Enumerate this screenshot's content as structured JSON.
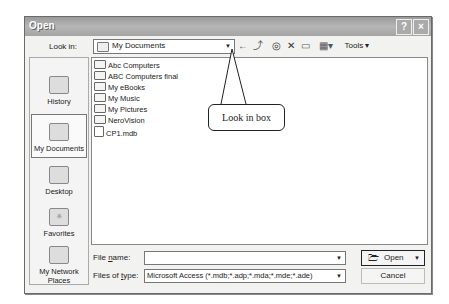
{
  "window": {
    "title": "Open",
    "help_glyph": "?",
    "close_glyph": "×"
  },
  "toolbar": {
    "look_in_label": "Look in:",
    "look_in_value": "My Documents",
    "back_icon": "←",
    "up_folder_icon": "⤴",
    "search_web_icon": "🔍",
    "delete_icon": "✕",
    "new_folder_icon": "🗀",
    "views_icon": "▦",
    "tools_label": "Tools"
  },
  "places": [
    {
      "label": "History"
    },
    {
      "label": "My Documents",
      "selected": true
    },
    {
      "label": "Desktop"
    },
    {
      "label": "Favorites"
    },
    {
      "label": "My Network Places"
    }
  ],
  "files": [
    {
      "name": "Abc Computers",
      "type": "folder"
    },
    {
      "name": "ABC Computers final",
      "type": "folder"
    },
    {
      "name": "My eBooks",
      "type": "folder"
    },
    {
      "name": "My Music",
      "type": "folder"
    },
    {
      "name": "My Pictures",
      "type": "folder"
    },
    {
      "name": "NeroVision",
      "type": "folder"
    },
    {
      "name": "CP1.mdb",
      "type": "file"
    }
  ],
  "callout": {
    "text": "Look in box"
  },
  "footer": {
    "file_name_label": "File name:",
    "file_name_value": "",
    "file_type_label": "Files of type:",
    "file_type_value": "Microsoft Access (*.mdb;*.adp;*.mda;*.mde;*.ade)",
    "open_label": "Open",
    "cancel_label": "Cancel"
  }
}
